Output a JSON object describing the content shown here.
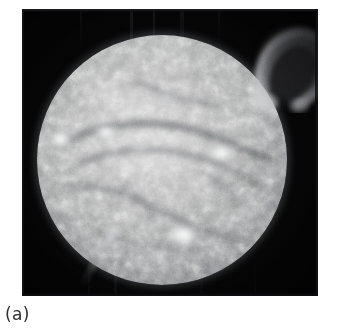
{
  "figure": {
    "caption": "(a)",
    "alt_description": "Grayscale extreme-ultraviolet image of the full solar disk with a large loop prominence on the upper right limb",
    "plate": {
      "background_color": "#050506",
      "x": 22,
      "y": 9,
      "width": 296,
      "height": 287
    },
    "page_background_color": "#ffffff",
    "caption_color": "#2e2e30"
  },
  "solar_disk": {
    "center_x": 140,
    "center_y": 151,
    "radius": 125,
    "surface_color": "#9a9b9b",
    "highlight_color": "#cfd0cf",
    "limb_color": "#5d5e64"
  },
  "features": {
    "prominence": {
      "name": "loop-prominence",
      "position": "upper-right-limb",
      "color": "#b9bbbf"
    },
    "limb_jet": {
      "name": "limb-jet",
      "position": "lower-left-limb",
      "color": "#8e9095"
    },
    "active_regions": [
      {
        "name": "active-region-west-limb",
        "cx": 23,
        "cy": 104,
        "rx": 13,
        "ry": 11,
        "intensity": 1.0
      },
      {
        "name": "active-region-north-west",
        "cx": 69,
        "cy": 97,
        "rx": 15,
        "ry": 10,
        "intensity": 0.92
      },
      {
        "name": "active-region-north-central",
        "cx": 104,
        "cy": 112,
        "rx": 12,
        "ry": 8,
        "intensity": 0.7
      },
      {
        "name": "active-region-east-central",
        "cx": 184,
        "cy": 118,
        "rx": 18,
        "ry": 12,
        "intensity": 0.95
      },
      {
        "name": "active-region-south-central",
        "cx": 146,
        "cy": 200,
        "rx": 19,
        "ry": 14,
        "intensity": 1.0
      },
      {
        "name": "active-region-south-east",
        "cx": 206,
        "cy": 176,
        "rx": 11,
        "ry": 8,
        "intensity": 0.6
      },
      {
        "name": "active-region-south-west",
        "cx": 76,
        "cy": 196,
        "rx": 12,
        "ry": 9,
        "intensity": 0.66
      },
      {
        "name": "plage-north",
        "cx": 128,
        "cy": 62,
        "rx": 16,
        "ry": 8,
        "intensity": 0.45
      },
      {
        "name": "plage-east",
        "cx": 214,
        "cy": 108,
        "rx": 12,
        "ry": 9,
        "intensity": 0.55
      }
    ],
    "filaments": [
      {
        "name": "filament-north-arc"
      },
      {
        "name": "filament-central-dark-lane"
      },
      {
        "name": "filament-south-arc"
      }
    ]
  }
}
